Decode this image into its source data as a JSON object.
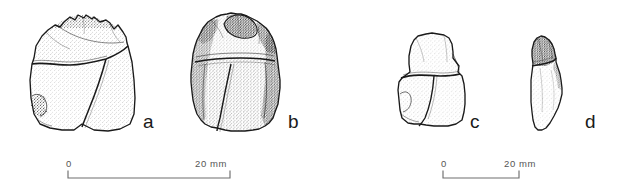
{
  "figure": {
    "type": "archaeological-line-drawing",
    "background_color": "#ffffff",
    "ink_color": "#1a1a1a",
    "shading_technique": "stipple",
    "artifacts": [
      {
        "id": "a",
        "label": "a",
        "description": "stone flake, ventral view with cortex remnant along upper margin",
        "label_x": 143,
        "label_y": 112
      },
      {
        "id": "b",
        "label": "b",
        "description": "stone flake, dorsal view with heavy stippled shading and dark cortex patches",
        "label_x": 288,
        "label_y": 112
      },
      {
        "id": "c",
        "label": "c",
        "description": "small stone fragment, bifacial view",
        "label_x": 470,
        "label_y": 112
      },
      {
        "id": "d",
        "label": "d",
        "description": "narrow elongated flake, profile view with dark proximal end",
        "label_x": 585,
        "label_y": 112
      }
    ],
    "scale_bars": [
      {
        "id": "scale-left",
        "start_label": "0",
        "end_label": "20 mm",
        "unit": "mm",
        "length_value": 20,
        "applies_to": [
          "a",
          "b"
        ],
        "x": 62,
        "y": 160,
        "bar_width": 162
      },
      {
        "id": "scale-right",
        "start_label": "0",
        "end_label": "20 mm",
        "unit": "mm",
        "length_value": 20,
        "applies_to": [
          "c",
          "d"
        ],
        "x": 437,
        "y": 160,
        "bar_width": 76
      }
    ]
  }
}
